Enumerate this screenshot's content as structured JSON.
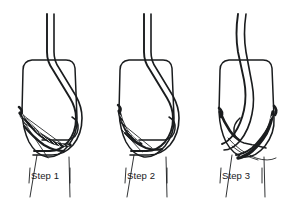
{
  "figure": {
    "background_color": "#ffffff",
    "ink_color": "#1a1c1e",
    "panel_count": 3
  },
  "panels": [
    {
      "id": "step-1",
      "label": "Step 1",
      "description": "Tooth crown outline with archwire passing over bracket; ligature wire fully twisted and braided along the lower left gingival margin, free ends extending down and across the bracket.",
      "label_x": 31,
      "label_y": 170,
      "origin_x": 4,
      "braid_side": "left",
      "braid_density": "heavy"
    },
    {
      "id": "step-2",
      "label": "Step 2",
      "description": "Archwire seated in bracket slot; ligature wire drawn tight with short twisted segment at the lower left, loose tail trimmed.",
      "label_x": 127,
      "label_y": 170,
      "origin_x": 100,
      "braid_side": "left",
      "braid_density": "light"
    },
    {
      "id": "step-3",
      "label": "Step 3",
      "description": "Archwire rotated and tucked; twisted ligature pigtail folded over to the lower right of the bracket against the tooth surface.",
      "label_x": 222,
      "label_y": 170,
      "origin_x": 196,
      "braid_side": "right",
      "braid_density": "heavy"
    }
  ]
}
